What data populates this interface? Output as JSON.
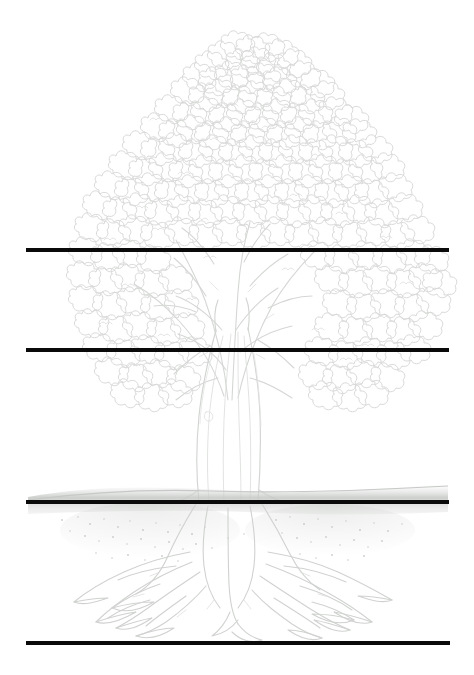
{
  "page": {
    "background_color": "#ffffff",
    "width": 474,
    "height": 675
  },
  "illustration": {
    "name": "tree-with-roots-line-drawing",
    "style": "faint pencil line art",
    "line_color": "#d6d8d6",
    "shade_color": "#c9ccc9",
    "parts": [
      {
        "name": "canopy",
        "label": "Leaf canopy",
        "top": 38,
        "bottom": 400,
        "left": 65,
        "right": 428
      },
      {
        "name": "branches",
        "label": "Branches",
        "top": 215,
        "bottom": 420
      },
      {
        "name": "trunk",
        "label": "Trunk",
        "top": 330,
        "bottom": 505,
        "left": 195,
        "right": 265
      },
      {
        "name": "ground",
        "label": "Ground line with soil",
        "top": 487,
        "bottom": 525
      },
      {
        "name": "roots",
        "label": "Root system",
        "top": 510,
        "bottom": 625,
        "left": 80,
        "right": 400
      }
    ]
  },
  "writing_lines": [
    {
      "id": "line-1",
      "y": 250,
      "x_start": 26,
      "x_end": 449,
      "thickness": 4,
      "color": "#0a0a0a"
    },
    {
      "id": "line-2",
      "y": 350,
      "x_start": 26,
      "x_end": 449,
      "thickness": 4,
      "color": "#0a0a0a"
    },
    {
      "id": "line-3",
      "y": 502,
      "x_start": 26,
      "x_end": 449,
      "thickness": 4,
      "color": "#0a0a0a"
    },
    {
      "id": "line-4",
      "y": 643,
      "x_start": 26,
      "x_end": 450,
      "thickness": 4,
      "color": "#0a0a0a"
    }
  ]
}
